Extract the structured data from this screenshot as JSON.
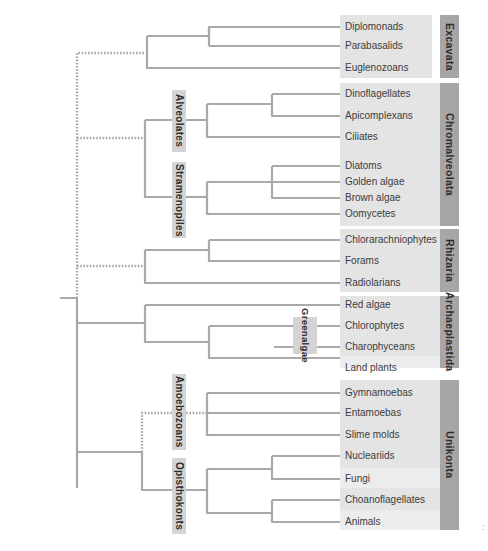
{
  "diagram": {
    "type": "phylogenetic-tree",
    "colors": {
      "branch": "#a9a9a9",
      "band": "#e4e4e4",
      "group_tab": "#a6a6a6",
      "clade_tag": "#d4d4d4"
    },
    "supergroups": [
      {
        "name": "Excavata",
        "taxa": [
          "Diplomonads",
          "Parabasalids",
          "Euglenozoans"
        ]
      },
      {
        "name": "Chromalveolata",
        "taxa": [
          "Dinoflagellates",
          "Apicomplexans",
          "Ciliates",
          "Diatoms",
          "Golden algae",
          "Brown algae",
          "Oomycetes"
        ]
      },
      {
        "name": "Rhizaria",
        "taxa": [
          "Chlorarachniophytes",
          "Forams",
          "Radiolarians"
        ]
      },
      {
        "name": "Archaeplastida",
        "taxa": [
          "Red algae",
          "Chlorophytes",
          "Charophyceans",
          "Land plants"
        ]
      },
      {
        "name": "Unikonta",
        "taxa": [
          "Gymnamoebas",
          "Entamoebas",
          "Slime molds",
          "Nucleariids",
          "Fungi",
          "Choanoflagellates",
          "Animals"
        ]
      }
    ],
    "clades": {
      "alveolates": "Alveolates",
      "stramenopiles": "Stramenopiles",
      "green_algae_line1": "Green",
      "green_algae_line2": "algae",
      "amoebozoans": "Amoebozoans",
      "opisthokonts": "Opisthokonts"
    },
    "footnote": ":"
  }
}
